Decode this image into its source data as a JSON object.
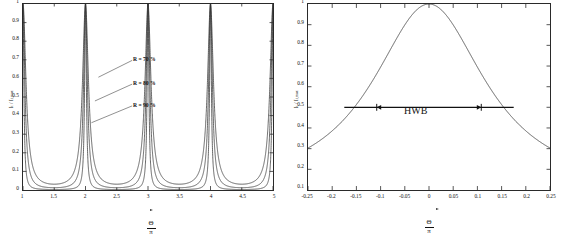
{
  "figure": {
    "background": "#ffffff",
    "line_color": "#333333",
    "axis_color": "#2a2a2a"
  },
  "chart_data": [
    {
      "type": "line",
      "panel": "left",
      "title": "",
      "xlabel_numerator": "Θ",
      "xlabel_denominator": "π",
      "ylabel": "Iₜ / Iₜ,max",
      "xlim": [
        1,
        5
      ],
      "ylim": [
        0,
        1
      ],
      "grid": false,
      "legend_position": "inline-annotations",
      "xticks": [
        "1",
        "1.5",
        "2",
        "2.5",
        "3",
        "3.5",
        "4",
        "4.5",
        "5"
      ],
      "xtick_values": [
        1,
        1.5,
        2,
        2.5,
        3,
        3.5,
        4,
        4.5,
        5
      ],
      "yticks": [
        "0",
        "0.1",
        "0.2",
        "0.3",
        "0.4",
        "0.5",
        "0.6",
        "0.7",
        "0.8",
        "0.9",
        "1"
      ],
      "ytick_values": [
        0,
        0.1,
        0.2,
        0.3,
        0.4,
        0.5,
        0.6,
        0.7,
        0.8,
        0.9,
        1
      ],
      "peaks_at": [
        2,
        4
      ],
      "series": [
        {
          "name": "R = 70 %",
          "reflectivity": 0.7,
          "finesse_coefficient": 31.1,
          "baseline_min": 0.031,
          "annotation": "R = 70 %"
        },
        {
          "name": "R = 80 %",
          "reflectivity": 0.8,
          "finesse_coefficient": 80.0,
          "baseline_min": 0.012,
          "annotation": "R = 80 %"
        },
        {
          "name": "R = 90 %",
          "reflectivity": 0.9,
          "finesse_coefficient": 360.0,
          "baseline_min": 0.0028,
          "annotation": "R = 90 %"
        }
      ],
      "annotations": [
        {
          "text": "R = 70 %",
          "points_to_x": 2.06,
          "points_to_y": 0.3
        },
        {
          "text": "R = 80 %",
          "points_to_x": 2.04,
          "points_to_y": 0.26
        },
        {
          "text": "R = 90 %",
          "points_to_x": 2.02,
          "points_to_y": 0.22
        }
      ]
    },
    {
      "type": "line",
      "panel": "right",
      "title": "",
      "xlabel_numerator": "Θ",
      "xlabel_denominator": "π",
      "ylabel": "Iₜ / Iₜ,max",
      "xlim": [
        -0.25,
        0.25
      ],
      "ylim": [
        0.1,
        1
      ],
      "grid": false,
      "legend_position": "none",
      "xticks": [
        "-0.25",
        "-0.2",
        "-0.15",
        "-0.1",
        "-0.05",
        "0",
        "0.05",
        "0.1",
        "0.15",
        "0.2",
        "0.25"
      ],
      "xtick_values": [
        -0.25,
        -0.2,
        -0.15,
        -0.1,
        -0.05,
        0,
        0.05,
        0.1,
        0.15,
        0.2,
        0.25
      ],
      "yticks": [
        "0.1",
        "0.2",
        "0.3",
        "0.4",
        "0.5",
        "0.6",
        "0.7",
        "0.8",
        "0.9",
        "1"
      ],
      "ytick_values": [
        0.1,
        0.2,
        0.3,
        0.4,
        0.5,
        0.6,
        0.7,
        0.8,
        0.9,
        1
      ],
      "peak_x": 0,
      "peak_y": 1,
      "edge_y": 0.175,
      "series": [
        {
          "name": "transmission",
          "finesse_coefficient": 4.6,
          "values_note": "Airy function single order"
        }
      ],
      "measurement": {
        "label": "HWB",
        "level_y": 0.5,
        "left_x": -0.108,
        "right_x": 0.108,
        "bar_left_x": -0.175,
        "bar_right_x": 0.175,
        "width": 0.216
      }
    }
  ]
}
